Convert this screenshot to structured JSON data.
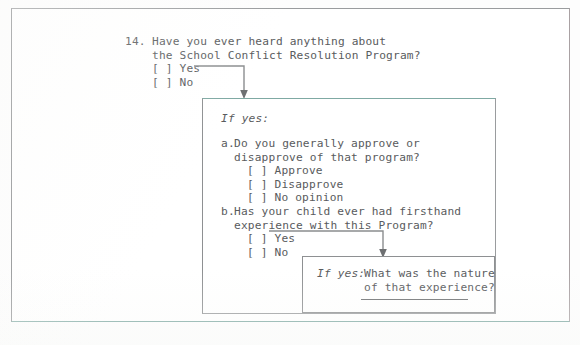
{
  "document": {
    "type": "survey-questionnaire-skip-logic-diagram",
    "question": {
      "number": "14.",
      "text": "Have you ever heard anything about\nthe School Conflict Resolution Program?",
      "options": "[ ] Yes\n[ ] No",
      "option_list": [
        "[ ] Yes",
        "[ ] No"
      ]
    },
    "box_a": {
      "conditional_label": "If yes:",
      "sub_a": {
        "label": "a.",
        "text": "Do you generally approve or\ndisapprove of that program?",
        "options": "[ ] Approve\n[ ] Disapprove\n[ ] No opinion",
        "option_list": [
          "[ ] Approve",
          "[ ] Disapprove",
          "[ ] No opinion"
        ]
      },
      "sub_b": {
        "label": "b.",
        "text": "Has your child ever had firsthand\nexperience with this Program?",
        "options": "[ ] Yes\n[ ] No",
        "option_list": [
          "[ ] Yes",
          "[ ] No"
        ]
      }
    },
    "box_b": {
      "conditional_label": "If yes:",
      "text": "What was the nature\nof that experience?",
      "answer_line_value": ""
    }
  },
  "colors": {
    "text": "#595b5d",
    "rule": "#6e7072",
    "border_gray": "#8e9092",
    "border_teal": "#7fa9a3",
    "paper": "#ffffff"
  },
  "icons": {
    "arrow_from_q14_yes": "down-arrow-icon",
    "arrow_from_sub_b_yes": "down-arrow-icon"
  }
}
